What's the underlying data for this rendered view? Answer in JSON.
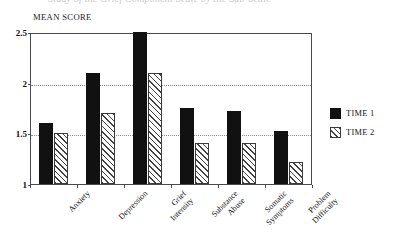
{
  "caption": {
    "text": "Study of the Grief Component Scale by the Sub-Scale"
  },
  "chart_data": {
    "type": "bar",
    "title": "",
    "ylabel": "MEAN SCORE",
    "xlabel": "",
    "ylim": [
      1,
      2.5
    ],
    "yticks": [
      "1",
      "1.5",
      "2",
      "2.5"
    ],
    "ytick_values": [
      1,
      1.5,
      2,
      2.5
    ],
    "gridlines": [
      1.5,
      2
    ],
    "grid": true,
    "legend_position": "right",
    "categories": [
      "Anxiety",
      "Depression",
      "Grief Intensity",
      "Substance Abuse",
      "Somatic Symptoms",
      "Problem Difficulty"
    ],
    "series": [
      {
        "name": "TIME 1",
        "pattern": "solid",
        "color": "#111111",
        "values": [
          1.6,
          2.1,
          2.5,
          1.75,
          1.72,
          1.52
        ]
      },
      {
        "name": "TIME 2",
        "pattern": "diagonal-hatch",
        "color": "#ffffff",
        "values": [
          1.5,
          1.7,
          2.1,
          1.4,
          1.4,
          1.22
        ]
      }
    ]
  },
  "legend": {
    "items": [
      {
        "label": "TIME 1",
        "pattern": "solid"
      },
      {
        "label": "TIME 2",
        "pattern": "diagonal-hatch"
      }
    ]
  }
}
